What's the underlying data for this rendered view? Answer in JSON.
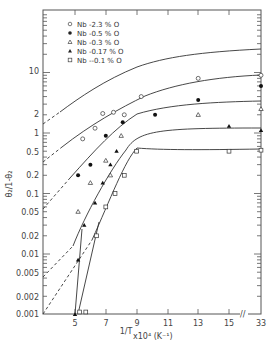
{
  "chart_data": {
    "type": "line",
    "title": "",
    "xlabel": "1/T x10^4 (K^-1)",
    "ylabel": "θ2/1-θ2",
    "yscale": "log",
    "ylim": [
      0.001,
      100
    ],
    "xlim": [
      3,
      33
    ],
    "x_ticks": [
      "5",
      "7",
      "9",
      "11",
      "13",
      "15",
      "33"
    ],
    "x_axis_break": "between 15 and 33",
    "y_ticks": [
      "10",
      "2",
      "1",
      "0.5",
      "0.2",
      "0.1",
      "0.05",
      "0.02",
      "0.01",
      "0.005",
      "0.002",
      "0.001"
    ],
    "grid": false,
    "legend_position": "upper left inside",
    "series": [
      {
        "name": "Nb -2.3 % O",
        "marker": "open-circle",
        "points": [
          [
            5.5,
            0.8
          ],
          [
            6.3,
            1.2
          ],
          [
            6.8,
            2.1
          ],
          [
            7.5,
            2.2
          ],
          [
            8.2,
            2.0
          ],
          [
            9.3,
            4.0
          ],
          [
            13,
            8.0
          ],
          [
            33,
            9.0
          ]
        ],
        "extrapolation": "dashed to low x"
      },
      {
        "name": "Nb -0.5 % O",
        "marker": "filled-circle",
        "points": [
          [
            5.2,
            0.2
          ],
          [
            6.0,
            0.3
          ],
          [
            7.0,
            0.9
          ],
          [
            8.1,
            1.5
          ],
          [
            10.2,
            2.0
          ],
          [
            13,
            3.5
          ],
          [
            33,
            6.0
          ]
        ],
        "extrapolation": "dashed to low x"
      },
      {
        "name": "Nb -0.3 % O",
        "marker": "open-triangle",
        "points": [
          [
            5.2,
            0.05
          ],
          [
            6.0,
            0.15
          ],
          [
            7.0,
            0.35
          ],
          [
            7.3,
            0.2
          ],
          [
            8.0,
            0.9
          ],
          [
            13,
            2.0
          ],
          [
            33,
            2.5
          ]
        ],
        "extrapolation": "dashed to low x"
      },
      {
        "name": "Nb -0.17 % O",
        "marker": "filled-triangle",
        "points": [
          [
            5.0,
            0.001
          ],
          [
            5.2,
            0.008
          ],
          [
            5.6,
            0.03
          ],
          [
            6.3,
            0.07
          ],
          [
            6.8,
            0.15
          ],
          [
            7.3,
            0.3
          ],
          [
            7.7,
            0.5
          ],
          [
            9.0,
            0.5
          ],
          [
            15,
            1.3
          ],
          [
            33,
            1.1
          ]
        ],
        "extrapolation": "dashed to low x"
      },
      {
        "name": "Nb --0.1 % O",
        "marker": "open-square",
        "points": [
          [
            5.3,
            0.0011
          ],
          [
            5.7,
            0.0011
          ],
          [
            6.4,
            0.02
          ],
          [
            7.0,
            0.06
          ],
          [
            7.6,
            0.1
          ],
          [
            8.2,
            0.2
          ],
          [
            9.0,
            0.5
          ],
          [
            15,
            0.5
          ],
          [
            33,
            0.52
          ]
        ],
        "extrapolation": "dashed to low x"
      }
    ]
  },
  "legend": [
    {
      "label": "Nb -2.3  % O"
    },
    {
      "label": "Nb -0.5  % O"
    },
    {
      "label": "Nb -0.3  % O"
    },
    {
      "label": "Nb -0.17 % O"
    },
    {
      "label": "Nb --0.1  % O"
    }
  ],
  "axes": {
    "ylabel": "θ₂/1-θ₂",
    "xlabel_frac": "1/T",
    "xlabel_rest": "x10⁴ (K⁻¹)",
    "xticks": [
      "5",
      "7",
      "9",
      "11",
      "13",
      "15",
      "33"
    ],
    "yticks": [
      "10",
      "2",
      "1",
      "0.5",
      "0.2",
      "0.1",
      "0.05",
      "0.02",
      "0.01",
      "0.005",
      "0.002",
      "0.001"
    ],
    "break_mark": "//"
  }
}
